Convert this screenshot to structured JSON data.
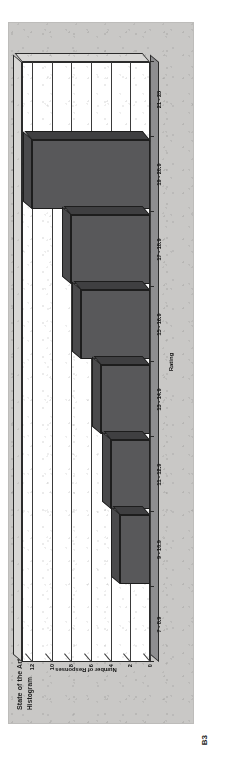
{
  "page": {
    "figure_caption": "B3"
  },
  "chart_data": {
    "type": "bar",
    "title": "State of the Art?",
    "subtitle": "Histogram",
    "xlabel": "Rating",
    "ylabel": "Number of Responses",
    "categories": [
      "7 - 8.9",
      "9 - 10.9",
      "11 - 12.9",
      "13 - 14.9",
      "15 - 16.9",
      "17 - 18.9",
      "19 - 20.9",
      "21 - 23"
    ],
    "values": [
      0,
      3,
      4,
      5,
      7,
      8,
      12,
      0
    ],
    "ylim": [
      0,
      13
    ],
    "yticks": [
      0,
      2,
      4,
      6,
      8,
      10,
      12
    ],
    "ytick_labels": [
      "0",
      "2",
      "4",
      "6",
      "8",
      "10",
      "12"
    ],
    "grid": true,
    "legend": false,
    "style": "3d-bar",
    "bar_color": "#58585a",
    "plot_bg": "#ffffff",
    "figure_bg": "#c9c8c6"
  }
}
